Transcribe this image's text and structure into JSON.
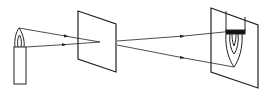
{
  "diagram": {
    "title": "Pinhole camera image formation",
    "elements": {
      "candle": "candle",
      "flame": "candle-flame",
      "pinhole_screen": "screen-with-pinhole",
      "image_screen": "projection-screen",
      "inverted_image": "inverted-candle-image"
    },
    "colors": {
      "stroke": "#222222",
      "background": "#ffffff"
    }
  }
}
